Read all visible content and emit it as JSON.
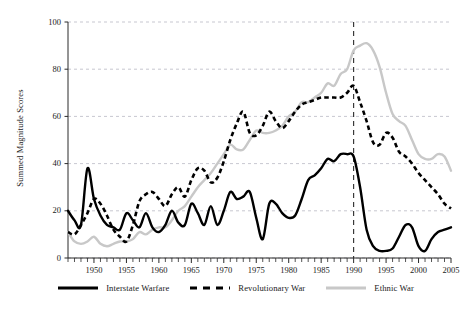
{
  "chart_data": {
    "type": "line",
    "title": "",
    "xlabel": "",
    "ylabel": "Summed Magnitude Scores",
    "xlim": [
      1946,
      2005
    ],
    "ylim": [
      0,
      100
    ],
    "yticks": [
      0,
      20,
      40,
      60,
      80,
      100
    ],
    "xticks": [
      1950,
      1955,
      1960,
      1965,
      1970,
      1975,
      1980,
      1985,
      1990,
      1995,
      2000,
      2005
    ],
    "xtick_minor_interval": 1,
    "grid": "horizontal-dashed",
    "legend_position": "bottom",
    "annotations": [
      {
        "type": "vline",
        "x": 1990,
        "style": "dashed",
        "color": "#2a2a2a"
      }
    ],
    "x": [
      1946,
      1947,
      1948,
      1949,
      1950,
      1951,
      1952,
      1953,
      1954,
      1955,
      1956,
      1957,
      1958,
      1959,
      1960,
      1961,
      1962,
      1963,
      1964,
      1965,
      1966,
      1967,
      1968,
      1969,
      1970,
      1971,
      1972,
      1973,
      1974,
      1975,
      1976,
      1977,
      1978,
      1979,
      1980,
      1981,
      1982,
      1983,
      1984,
      1985,
      1986,
      1987,
      1988,
      1989,
      1990,
      1991,
      1992,
      1993,
      1994,
      1995,
      1996,
      1997,
      1998,
      1999,
      2000,
      2001,
      2002,
      2003,
      2004,
      2005
    ],
    "series": [
      {
        "name": "Interstate Warfare",
        "color": "#000000",
        "style": "solid",
        "values": [
          20,
          16,
          14,
          38,
          25,
          18,
          14,
          13,
          12,
          19,
          16,
          13,
          19,
          13,
          11,
          14,
          20,
          15,
          14,
          23,
          19,
          14,
          22,
          14,
          20,
          28,
          25,
          26,
          28,
          17,
          8,
          23,
          23,
          19,
          17,
          18,
          25,
          33,
          35,
          38,
          42,
          41,
          44,
          44,
          43,
          30,
          12,
          5,
          3,
          3,
          4,
          9,
          14,
          13,
          5,
          3,
          8,
          11,
          12,
          13
        ]
      },
      {
        "name": "Revolutionary War",
        "color": "#000000",
        "style": "dashed",
        "values": [
          11,
          10,
          14,
          19,
          25,
          23,
          18,
          12,
          9,
          7,
          14,
          24,
          27,
          28,
          25,
          22,
          27,
          30,
          26,
          33,
          38,
          37,
          32,
          34,
          41,
          50,
          57,
          62,
          53,
          52,
          56,
          62,
          58,
          55,
          58,
          62,
          65,
          66,
          67,
          68,
          68,
          68,
          68,
          70,
          73,
          66,
          58,
          49,
          48,
          53,
          51,
          45,
          43,
          40,
          36,
          33,
          30,
          27,
          23,
          21
        ]
      },
      {
        "name": "Ethnic War",
        "color": "#c8c8c8",
        "style": "solid",
        "values": [
          11,
          7,
          6,
          7,
          9,
          6,
          5,
          6,
          7,
          7,
          8,
          11,
          10,
          12,
          13,
          13,
          16,
          20,
          22,
          26,
          30,
          33,
          36,
          40,
          44,
          48,
          46,
          46,
          50,
          54,
          53,
          53,
          54,
          56,
          60,
          62,
          66,
          66,
          68,
          70,
          74,
          73,
          78,
          80,
          88,
          90,
          91,
          88,
          81,
          70,
          61,
          58,
          56,
          50,
          44,
          42,
          42,
          44,
          43,
          37
        ]
      }
    ]
  },
  "axis": {
    "y_title": "Summed Magnitude Scores",
    "y_tick_labels": [
      "0",
      "20",
      "40",
      "60",
      "80",
      "100"
    ],
    "x_tick_labels": [
      "1950",
      "1955",
      "1960",
      "1965",
      "1970",
      "1975",
      "1980",
      "1985",
      "1990",
      "1995",
      "2000",
      "2005"
    ]
  },
  "legend": {
    "items": [
      {
        "label": "Interstate Warfare",
        "key": "solid-black-line"
      },
      {
        "label": "Revolutionary War",
        "key": "dashed-black-line"
      },
      {
        "label": "Ethnic War",
        "key": "solid-gray-line"
      }
    ]
  }
}
